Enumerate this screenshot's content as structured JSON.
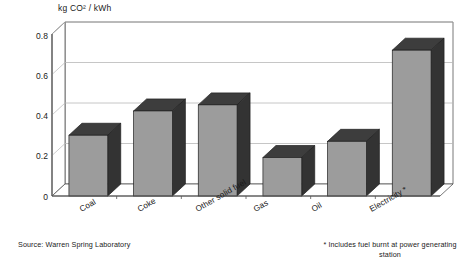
{
  "chart_data": {
    "type": "bar",
    "title": "",
    "subtitle": "",
    "xlabel": "",
    "ylabel": "kg CO² / kWh",
    "ylim": [
      0,
      0.8
    ],
    "yticks": [
      "0",
      "0.2",
      "0.4",
      "0.6",
      "0.8"
    ],
    "ytick_values": [
      0,
      0.2,
      0.4,
      0.6,
      0.8
    ],
    "grid": "horizontal",
    "legend": "none",
    "style": "3d-bar",
    "categories": [
      "Coal",
      "Coke",
      "Other solid fuel",
      "Gas",
      "Oil",
      "Electricity *"
    ],
    "values": [
      0.3,
      0.42,
      0.45,
      0.19,
      0.27,
      0.72
    ],
    "series": [
      {
        "name": "CO2 emissions",
        "values": [
          0.3,
          0.42,
          0.45,
          0.19,
          0.27,
          0.72
        ]
      }
    ],
    "annotations": [
      "Source: Warren Spring Laboratory",
      "* Includes fuel burnt at power generating station"
    ]
  },
  "axis": {
    "y_title": "kg CO² / kWh",
    "ticks": [
      {
        "label": "0.8",
        "value": 0.8
      },
      {
        "label": "0.6",
        "value": 0.6
      },
      {
        "label": "0.4",
        "value": 0.4
      },
      {
        "label": "0.2",
        "value": 0.2
      },
      {
        "label": "0",
        "value": 0
      }
    ]
  },
  "bars": [
    {
      "label": "Coal",
      "value": 0.3
    },
    {
      "label": "Coke",
      "value": 0.42
    },
    {
      "label": "Other solid fuel",
      "value": 0.45
    },
    {
      "label": "Gas",
      "value": 0.19
    },
    {
      "label": "Oil",
      "value": 0.27
    },
    {
      "label": "Electricity *",
      "value": 0.72
    }
  ],
  "notes": {
    "source": "Source: Warren Spring Laboratory",
    "footnote_line1": "* Includes fuel burnt at power generating",
    "footnote_line2": "station"
  },
  "colors": {
    "bar_front": "#9c9c9c",
    "bar_side": "#333333",
    "bar_top": "#3d3d3d",
    "grid": "#b8b8b8",
    "axis": "#555555",
    "background": "#ffffff",
    "text": "#1a1a1a"
  }
}
